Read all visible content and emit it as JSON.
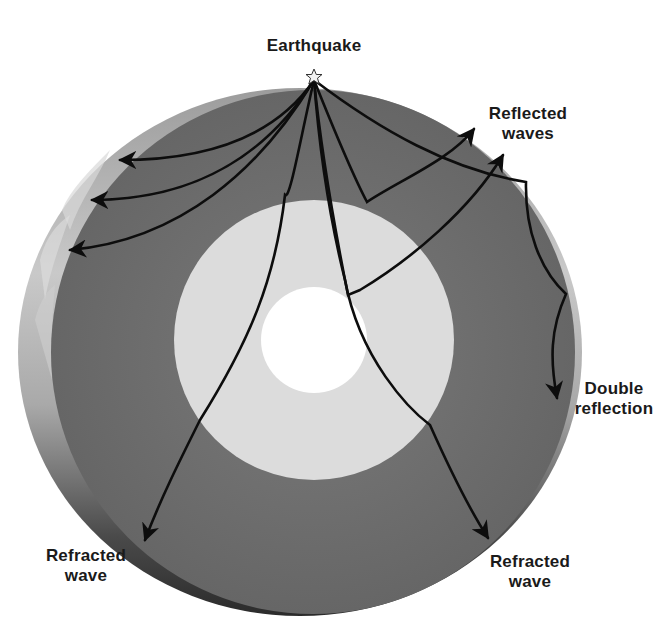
{
  "labels": {
    "earthquake": "Earthquake",
    "reflected_waves": [
      "Reflected",
      "waves"
    ],
    "double_reflection": [
      "Double",
      "reflection"
    ],
    "refracted_wave_left": [
      "Refracted",
      "wave"
    ],
    "refracted_wave_right": [
      "Refracted",
      "wave"
    ]
  },
  "layers": [
    {
      "name": "crust",
      "color": "#b8b8b8"
    },
    {
      "name": "mantle",
      "color": "#6f6f6f"
    },
    {
      "name": "outer-core",
      "color": "#dcdcdc"
    },
    {
      "name": "inner-core",
      "color": "#ffffff"
    }
  ],
  "colors": {
    "background": "#ffffff",
    "wave_line": "#0d0d0d",
    "text": "#1a1a1a",
    "star_fill": "#f2f2f2"
  }
}
